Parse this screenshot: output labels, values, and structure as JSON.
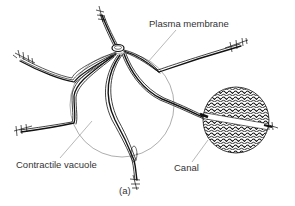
{
  "figure": {
    "caption": "(a)",
    "labels": {
      "plasma_membrane": "Plasma membrane",
      "contractile_vacuole": "Contractile vacuole",
      "canal": "Canal"
    },
    "colors": {
      "ink": "#111111",
      "leader_line": "#888888",
      "background": "#ffffff"
    }
  }
}
